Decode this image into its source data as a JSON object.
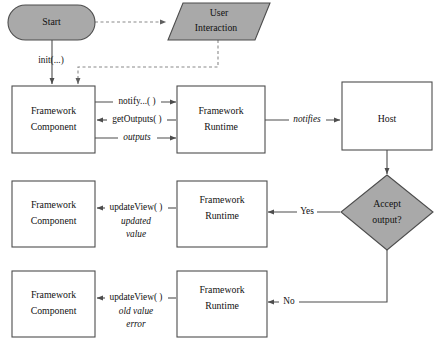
{
  "diagram": {
    "type": "flowchart",
    "colors": {
      "shape_gray": "#a9a9a9",
      "shape_white": "#ffffff",
      "stroke": "#4d4d4d",
      "dashed_stroke": "#8a8a8a",
      "text": "#111111",
      "background": "#ffffff"
    },
    "nodes": {
      "start": {
        "label": "Start",
        "shape": "stadium",
        "fill": "gray"
      },
      "user_interaction": {
        "label_line1": "User",
        "label_line2": "Interaction",
        "shape": "parallelogram",
        "fill": "gray"
      },
      "component_1": {
        "label_line1": "Framework",
        "label_line2": "Component",
        "shape": "rectangle",
        "fill": "white"
      },
      "runtime_1": {
        "label_line1": "Framework",
        "label_line2": "Runtime",
        "shape": "rectangle",
        "fill": "white"
      },
      "host": {
        "label": "Host",
        "shape": "rectangle",
        "fill": "white"
      },
      "component_2": {
        "label_line1": "Framework",
        "label_line2": "Component",
        "shape": "rectangle",
        "fill": "white"
      },
      "runtime_2": {
        "label_line1": "Framework",
        "label_line2": "Runtime",
        "shape": "rectangle",
        "fill": "white"
      },
      "decision": {
        "label_line1": "Accept",
        "label_line2": "output?",
        "shape": "diamond",
        "fill": "gray"
      },
      "component_3": {
        "label_line1": "Framework",
        "label_line2": "Component",
        "shape": "rectangle",
        "fill": "white"
      },
      "runtime_3": {
        "label_line1": "Framework",
        "label_line2": "Runtime",
        "shape": "rectangle",
        "fill": "white"
      }
    },
    "edge_labels": {
      "init": "init(...)",
      "notify": "notify...( )",
      "get_outputs": "getOutputs( )",
      "outputs": "outputs",
      "notifies": "notifies",
      "yes": "Yes",
      "no": "No",
      "update_view_2": "updateView( )",
      "updated": "updated",
      "value": "value",
      "update_view_3": "updateView( )",
      "old_value": "old value",
      "error": "error"
    }
  }
}
